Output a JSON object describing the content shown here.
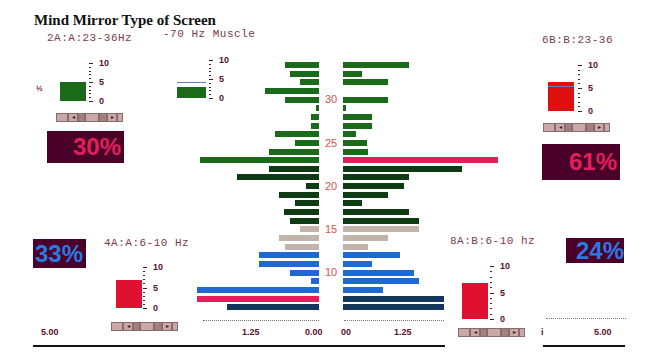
{
  "title": "Mind Mirror Type of Screen",
  "channels": {
    "top_left": {
      "label": "2A:A:23-36Hz",
      "side_char": "½",
      "percent": "30%",
      "percent_color": "#e0205a",
      "box_color": "#1a6a1a",
      "box_value": 5
    },
    "top_center": {
      "label": "-70 Hz Muscle",
      "box_color": "#1a6a1a",
      "box_value": 3,
      "marker_value": 4.2
    },
    "top_right": {
      "label": "6B:B:23-36",
      "percent": "61%",
      "percent_color": "#e0205a",
      "box_color": "#e01010",
      "box_value": 6.2,
      "marker_value": 5.5
    },
    "bottom_left": {
      "label": "4A:A:6-10 Hz",
      "percent": "33%",
      "percent_color": "#2a7ae0",
      "box_color": "#e01030",
      "box_value": 6.8
    },
    "bottom_right": {
      "label": "8A:B:6-10 hz",
      "percent": "24%",
      "percent_color": "#2a7ae0",
      "box_color": "#e01030",
      "box_value": 6.8
    }
  },
  "gauge_scale": {
    "labels": [
      "10",
      "5",
      "0"
    ]
  },
  "controls": {
    "left_arrow": "◂",
    "right_arrow": "▸"
  },
  "axis": {
    "left_outer": "5.00",
    "left_mid": "1.25",
    "left_zero": "0.00",
    "right_zero": "00",
    "right_mid": "1.25",
    "right_outer": "5.00",
    "right_outer_prefix": "i"
  },
  "row_labels": [
    "30",
    "25",
    "20",
    "15",
    "10"
  ],
  "chart_data": {
    "type": "bar",
    "xlabel": "Amplitude",
    "ylabel": "Frequency (Hz)",
    "categories": [
      34,
      33,
      32,
      31,
      30,
      29,
      28,
      27,
      26,
      25,
      24,
      23,
      22,
      21,
      20,
      19,
      18,
      17,
      16,
      15,
      14,
      13,
      12,
      11,
      10,
      9,
      8,
      7,
      6
    ],
    "series": [
      {
        "name": "Left (A)",
        "values": [
          0.68,
          0.58,
          0.38,
          1.09,
          0.68,
          0.06,
          0.16,
          0.16,
          0.88,
          0.48,
          1.0,
          2.39,
          1.0,
          1.65,
          0.26,
          0.8,
          0.48,
          0.7,
          0.58,
          0.38,
          0.8,
          0.68,
          1.21,
          1.21,
          0.58,
          0.16,
          2.46,
          2.46,
          1.85
        ]
      },
      {
        "name": "Right (B)",
        "values": [
          1.33,
          0.38,
          0.9,
          0.0,
          0.9,
          0.06,
          0.58,
          0.58,
          0.26,
          0.48,
          0.5,
          3.13,
          2.4,
          1.33,
          1.23,
          0.9,
          0.38,
          1.33,
          1.53,
          1.53,
          0.9,
          0.5,
          1.15,
          0.58,
          1.43,
          1.53,
          0.81,
          2.04,
          2.04
        ]
      }
    ],
    "colors": [
      "#1a6a1a",
      "#1a6a1a",
      "#1a6a1a",
      "#1a6a1a",
      "#1a6a1a",
      "#1a6a1a",
      "#1a6a1a",
      "#1a6a1a",
      "#1a6a1a",
      "#1a6a1a",
      "#1a6a1a",
      "#1a6a1a",
      "#0e3a14",
      "#0e3a14",
      "#0e3a14",
      "#0e3a14",
      "#0e3a14",
      "#0e3a14",
      "#0e3a14",
      "#c2b4a8",
      "#c2b4a8",
      "#c2b4a8",
      "#1f6ad0",
      "#1f6ad0",
      "#1f6ad0",
      "#1f6ad0",
      "#1f6ad0",
      "#1f6ad0",
      "#14365a"
    ],
    "highlight": {
      "left_row": 7,
      "right_row": 23,
      "color": "#e0205a"
    },
    "xlim": [
      0,
      1.25
    ],
    "x_ticks": [
      "1.25",
      "0.00",
      "00",
      "1.25"
    ]
  }
}
